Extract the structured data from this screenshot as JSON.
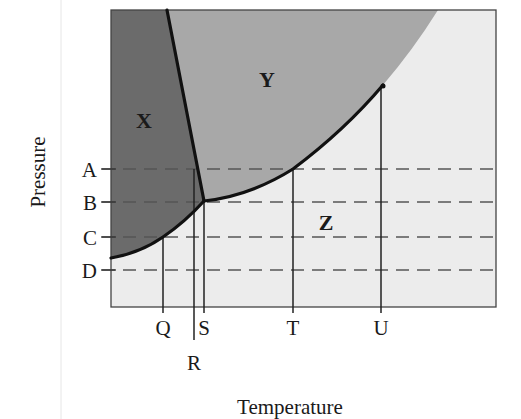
{
  "diagram": {
    "x_axis_title": "Temperature",
    "y_axis_title": "Pressure",
    "regions": [
      {
        "id": "X",
        "label": "X",
        "color": "#6b6b6b"
      },
      {
        "id": "Y",
        "label": "Y",
        "color": "#a8a8a8"
      },
      {
        "id": "Z",
        "label": "Z",
        "color": "#ececec"
      }
    ],
    "pressure_levels": [
      {
        "label": "A"
      },
      {
        "label": "B"
      },
      {
        "label": "C"
      },
      {
        "label": "D"
      }
    ],
    "temperature_points": [
      {
        "label": "Q"
      },
      {
        "label": "R"
      },
      {
        "label": "S"
      },
      {
        "label": "T"
      },
      {
        "label": "U"
      }
    ],
    "colors": {
      "frame": "#444444",
      "curve": "#111111",
      "dashed": "#555555",
      "background": "#ffffff"
    }
  }
}
